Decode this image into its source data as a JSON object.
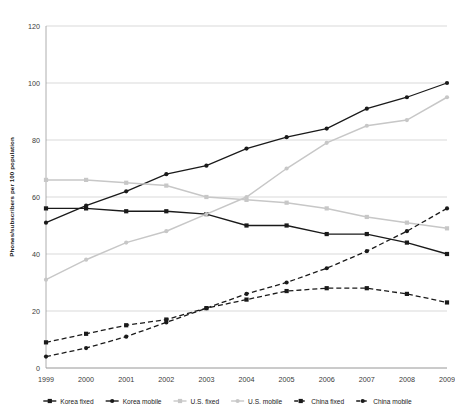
{
  "chart_data": {
    "type": "line",
    "title": "",
    "subtitle": "",
    "xlabel": "",
    "ylabel": "Phones/subscribers per 100 population",
    "categories": [
      "1999",
      "2000",
      "2001",
      "2002",
      "2003",
      "2004",
      "2005",
      "2006",
      "2007",
      "2008",
      "2009"
    ],
    "x": [
      1999,
      2000,
      2001,
      2002,
      2003,
      2004,
      2005,
      2006,
      2007,
      2008,
      2009
    ],
    "ylim": [
      0,
      120
    ],
    "yticks": [
      0,
      20,
      40,
      60,
      80,
      100,
      120
    ],
    "xlim": [
      1999,
      2009
    ],
    "grid": "horizontal",
    "legend_position": "bottom",
    "series": [
      {
        "name": "Korea fixed",
        "color": "#1a1a1a",
        "style": "solid",
        "marker": "square",
        "values": [
          56,
          56,
          55,
          55,
          54,
          50,
          50,
          47,
          47,
          44,
          40
        ]
      },
      {
        "name": "Korea mobile",
        "color": "#1a1a1a",
        "style": "solid",
        "marker": "circle",
        "values": [
          51,
          57,
          62,
          68,
          71,
          77,
          81,
          84,
          91,
          95,
          100
        ]
      },
      {
        "name": "U.S. fixed",
        "color": "#c7c7c7",
        "style": "solid",
        "marker": "square",
        "values": [
          66,
          66,
          65,
          64,
          60,
          59,
          58,
          56,
          53,
          51,
          49
        ]
      },
      {
        "name": "U.S. mobile",
        "color": "#c7c7c7",
        "style": "solid",
        "marker": "circle",
        "values": [
          31,
          38,
          44,
          48,
          54,
          60,
          70,
          79,
          85,
          87,
          95
        ]
      },
      {
        "name": "China fixed",
        "color": "#1a1a1a",
        "style": "dashed",
        "marker": "square",
        "values": [
          9,
          12,
          15,
          17,
          21,
          24,
          27,
          28,
          28,
          26,
          23
        ]
      },
      {
        "name": "China mobile",
        "color": "#1a1a1a",
        "style": "dashed",
        "marker": "circle",
        "values": [
          4,
          7,
          11,
          16,
          21,
          26,
          30,
          35,
          41,
          48,
          56
        ]
      }
    ]
  },
  "legend": {
    "items": [
      {
        "label": "Korea fixed"
      },
      {
        "label": "Korea mobile"
      },
      {
        "label": "U.S. fixed"
      },
      {
        "label": "U.S. mobile"
      },
      {
        "label": "China fixed"
      },
      {
        "label": "China mobile"
      }
    ]
  }
}
